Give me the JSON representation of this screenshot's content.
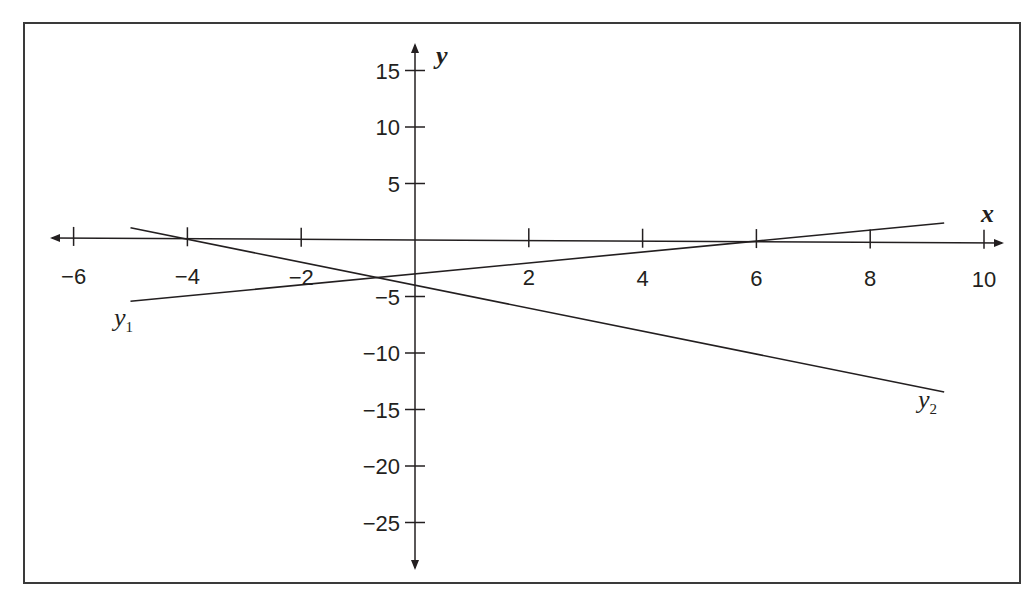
{
  "chart_data": {
    "type": "line",
    "title": "",
    "xlabel": "x",
    "ylabel": "y",
    "xlim": [
      -6,
      10
    ],
    "ylim": [
      -25,
      15
    ],
    "grid": false,
    "legend": "inline labels near line ends",
    "x_ticks": [
      "−6",
      "−4",
      "−2",
      "2",
      "4",
      "6",
      "8",
      "10"
    ],
    "x_tick_values": [
      -6,
      -4,
      -2,
      2,
      4,
      6,
      8,
      10
    ],
    "y_ticks": [
      "15",
      "10",
      "5",
      "−5",
      "−10",
      "−15",
      "−20",
      "−25"
    ],
    "y_tick_values": [
      15,
      10,
      5,
      -5,
      -10,
      -15,
      -20,
      -25
    ],
    "series": [
      {
        "name": "y1",
        "label_main": "y",
        "label_sub": "1",
        "equation": "y = 0.5x − 3",
        "x": [
          -5,
          9.3
        ],
        "values": [
          -5.5,
          1.65
        ]
      },
      {
        "name": "y2",
        "label_main": "y",
        "label_sub": "2",
        "equation": "y = −x − 4",
        "x": [
          -5,
          9.3
        ],
        "values": [
          1,
          -13.3
        ]
      }
    ],
    "annotations": [
      "x-intercept of y2 at −4",
      "x-intercept of y1 at 6",
      "lines intersect near (−0.67, −3.33)"
    ]
  }
}
